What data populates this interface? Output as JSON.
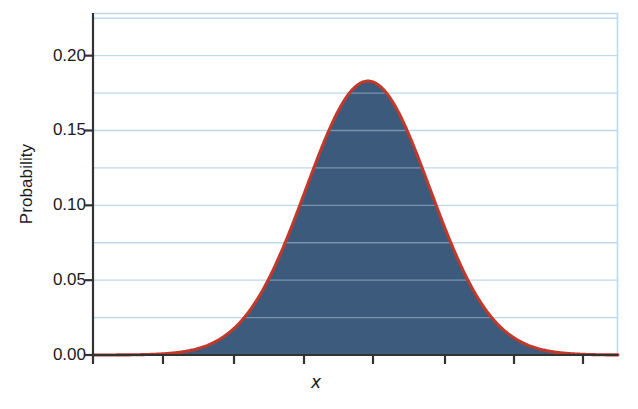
{
  "chart_data": {
    "type": "area",
    "title": "",
    "xlabel": "x",
    "ylabel": "Probability",
    "ylim": [
      0.0,
      0.2285
    ],
    "xlim": [
      0,
      525
    ],
    "grid": true,
    "legend": null,
    "y_ticks": [
      0.0,
      0.05,
      0.1,
      0.15,
      0.2
    ],
    "y_tick_labels": [
      "0.00",
      "0.05",
      "0.10",
      "0.15",
      "0.20"
    ],
    "y_minor_gridlines": [
      0.025,
      0.05,
      0.075,
      0.1,
      0.125,
      0.15,
      0.175,
      0.2,
      0.225
    ],
    "x_ticks": [
      163,
      234,
      304,
      373,
      445,
      514,
      583
    ],
    "x_tick_labels": [
      "",
      "",
      "",
      "",
      "",
      "",
      ""
    ],
    "distribution": "normal",
    "peak_value": 0.183,
    "peak_x": 368,
    "sigma_px": 62,
    "curve_color": "#c0392b",
    "fill_color": "#3c5b7d",
    "gridline_color": "#bcd9ed",
    "axis_color": "#333333",
    "series": [
      {
        "name": "Probability density",
        "x": [
          95,
          110,
          125,
          140,
          155,
          170,
          185,
          200,
          215,
          230,
          245,
          260,
          275,
          290,
          305,
          320,
          335,
          350,
          368,
          386,
          401,
          416,
          431,
          446,
          461,
          476,
          491,
          506,
          521,
          536,
          551,
          566,
          581,
          596,
          611,
          618
        ],
        "values": [
          0.0002,
          0.0005,
          0.001,
          0.0021,
          0.004,
          0.0072,
          0.0122,
          0.0195,
          0.0294,
          0.0419,
          0.0566,
          0.0724,
          0.088,
          0.1021,
          0.1134,
          0.1211,
          0.125,
          0.1259,
          0.183,
          0.1259,
          0.125,
          0.1211,
          0.1134,
          0.1021,
          0.088,
          0.0724,
          0.0566,
          0.0419,
          0.0294,
          0.0195,
          0.0122,
          0.0072,
          0.004,
          0.0021,
          0.001,
          0.0006
        ]
      }
    ]
  },
  "axes": {
    "y_title": "Probability",
    "x_title": "x"
  }
}
